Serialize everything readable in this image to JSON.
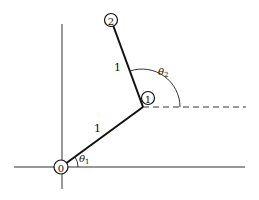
{
  "diagram": {
    "type": "two-link planar arm",
    "nodes": [
      {
        "id": "0",
        "label": "0",
        "cx": 61,
        "cy": 167
      },
      {
        "id": "1",
        "label": "1",
        "cx": 148,
        "cy": 98
      },
      {
        "id": "2",
        "label": "2",
        "cx": 111,
        "cy": 20
      }
    ],
    "links": [
      {
        "from": "0",
        "to": "1",
        "length_label": "1"
      },
      {
        "from": "1",
        "to": "2",
        "length_label": "1"
      }
    ],
    "angles": [
      {
        "name": "theta1",
        "symbol": "θ",
        "subscript": "1"
      },
      {
        "name": "theta2",
        "symbol": "θ",
        "subscript": "2"
      }
    ],
    "axes": {
      "x": "horizontal axis",
      "y": "vertical axis"
    },
    "reference_line": "dashed horizontal through joint 1",
    "colors": {
      "stroke": "#1a1a1a",
      "background": "#ffffff"
    }
  }
}
